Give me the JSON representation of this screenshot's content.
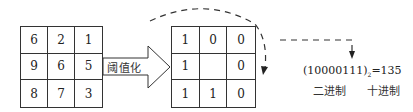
{
  "diagram": {
    "left_grid": {
      "rows": [
        [
          "6",
          "2",
          "1"
        ],
        [
          "9",
          "6",
          "5"
        ],
        [
          "8",
          "7",
          "3"
        ]
      ]
    },
    "arrow": {
      "label": "阈值化"
    },
    "right_grid": {
      "rows": [
        [
          "1",
          "0",
          "0"
        ],
        [
          "1",
          "",
          "0"
        ],
        [
          "1",
          "1",
          "0"
        ]
      ]
    },
    "result": {
      "binary_open": "(10000111)",
      "binary_sub": "2",
      "equals_decimal": "=135",
      "binary_label": "二进制",
      "decimal_label": "十进制"
    },
    "colors": {
      "line": "#333333",
      "background": "#ffffff"
    }
  }
}
